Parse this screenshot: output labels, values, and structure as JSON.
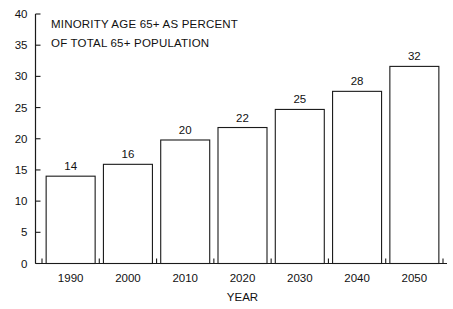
{
  "chart_data": {
    "type": "bar",
    "title_lines": [
      "MINORITY AGE 65+ AS PERCENT",
      "OF TOTAL 65+ POPULATION"
    ],
    "categories": [
      "1990",
      "2000",
      "2010",
      "2020",
      "2030",
      "2040",
      "2050"
    ],
    "values": [
      14,
      16,
      20,
      22,
      25,
      28,
      32
    ],
    "bar_tops": [
      14.0,
      15.9,
      19.8,
      21.8,
      24.7,
      27.6,
      31.6
    ],
    "data_labels": [
      "14",
      "16",
      "20",
      "22",
      "25",
      "28",
      "32"
    ],
    "xlabel": "YEAR",
    "ylabel": "",
    "ylim": [
      0,
      40
    ],
    "yticks": [
      0,
      5,
      10,
      15,
      20,
      25,
      30,
      35,
      40
    ],
    "ytick_labels": [
      "0",
      "5",
      "10",
      "15",
      "20",
      "25",
      "30",
      "35",
      "40"
    ],
    "grid": false,
    "legend": false,
    "legend_position": "none",
    "bar_fill_color": "#ffffff",
    "bar_edge_color": "#1a1a1a",
    "axis_color": "#1a1a1a",
    "background_color": "#ffffff"
  }
}
